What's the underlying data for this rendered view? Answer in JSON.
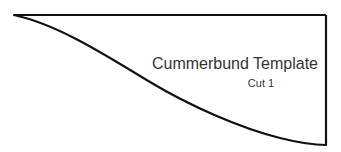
{
  "template": {
    "title": "Cummerbund Template",
    "subtitle": "Cut 1",
    "stroke_color": "#111111",
    "text_color": "#333333"
  }
}
